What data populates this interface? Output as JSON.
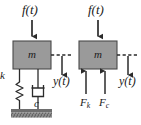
{
  "figure": {
    "background": "#ffffff",
    "width": 141,
    "height": 125,
    "colors": {
      "mass_fill": "#9a9a9a",
      "mass_stroke": "#4a4a4a",
      "line": "#2b2b2b",
      "ground_fill": "#8d8d8d",
      "text": "#1a1a1a"
    }
  },
  "left_diagram": {
    "name": "physical-model",
    "force_label": "f(t)",
    "mass_label": "m",
    "displacement_label": "y(t)",
    "spring_label": "k",
    "damper_label": "c",
    "ground": "hatched-fixed-support"
  },
  "right_diagram": {
    "name": "free-body-diagram",
    "force_label": "f(t)",
    "mass_label": "m",
    "displacement_label": "y(t)",
    "spring_force_label": "F",
    "spring_force_sub": "k",
    "damper_force_label": "F",
    "damper_force_sub": "c"
  }
}
